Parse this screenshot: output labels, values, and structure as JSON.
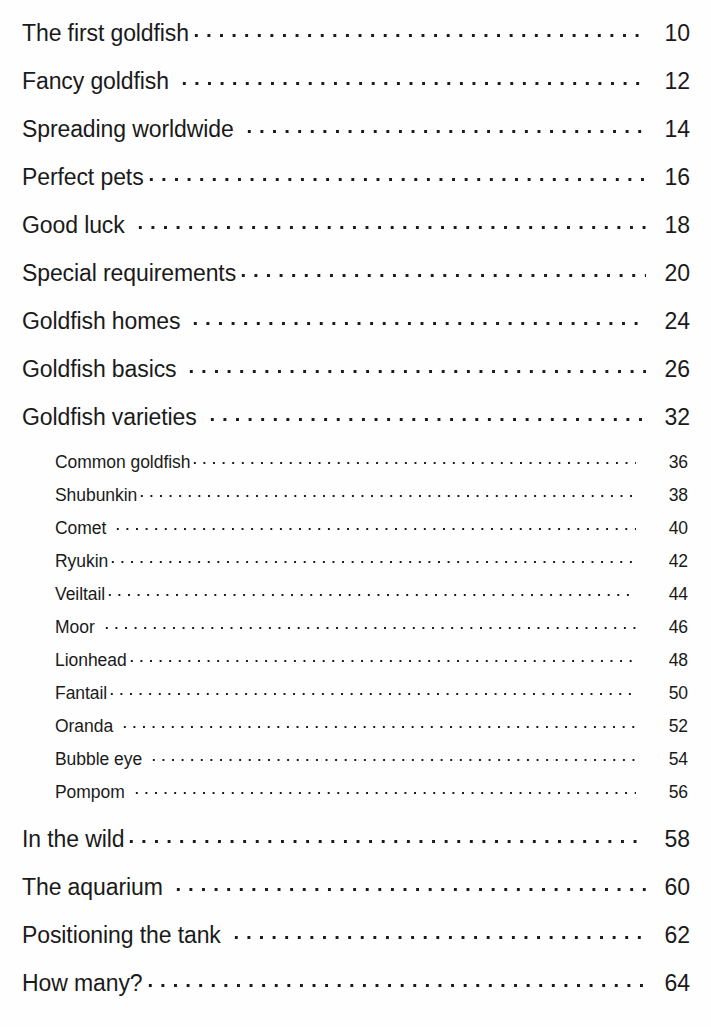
{
  "document": {
    "kind": "table-of-contents",
    "text_color": "#1a1a1a",
    "background_color": "#fefefe"
  },
  "contents": {
    "main_entries_top": [
      {
        "title": "The first goldfish",
        "page": "10",
        "leader_gap": "none"
      },
      {
        "title": "Fancy goldfish",
        "page": "12",
        "leader_gap": "wide"
      },
      {
        "title": "Spreading worldwide",
        "page": "14",
        "leader_gap": "wide"
      },
      {
        "title": "Perfect pets",
        "page": "16",
        "leader_gap": "none"
      },
      {
        "title": "Good luck",
        "page": "18",
        "leader_gap": "wide"
      },
      {
        "title": "Special requirements",
        "page": "20",
        "leader_gap": "none"
      },
      {
        "title": "Goldfish homes",
        "page": "24",
        "leader_gap": "wide"
      },
      {
        "title": "Goldfish basics",
        "page": "26",
        "leader_gap": "wide"
      },
      {
        "title": "Goldfish varieties",
        "page": "32",
        "leader_gap": "wide"
      }
    ],
    "sub_entries": [
      {
        "title": "Common goldfish",
        "page": "36",
        "leader_gap": "none"
      },
      {
        "title": "Shubunkin",
        "page": "38",
        "leader_gap": "none"
      },
      {
        "title": "Comet",
        "page": "40",
        "leader_gap": "wide"
      },
      {
        "title": "Ryukin",
        "page": "42",
        "leader_gap": "none"
      },
      {
        "title": "Veiltail",
        "page": "44",
        "leader_gap": "none"
      },
      {
        "title": "Moor",
        "page": "46",
        "leader_gap": "wide"
      },
      {
        "title": "Lionhead",
        "page": "48",
        "leader_gap": "none"
      },
      {
        "title": "Fantail",
        "page": "50",
        "leader_gap": "none"
      },
      {
        "title": "Oranda",
        "page": "52",
        "leader_gap": "wide"
      },
      {
        "title": "Bubble eye",
        "page": "54",
        "leader_gap": "wide"
      },
      {
        "title": "Pompom",
        "page": "56",
        "leader_gap": "wide"
      }
    ],
    "main_entries_bottom": [
      {
        "title": "In the wild",
        "page": "58",
        "leader_gap": "none"
      },
      {
        "title": "The aquarium",
        "page": "60",
        "leader_gap": "wide"
      },
      {
        "title": "Positioning the tank",
        "page": "62",
        "leader_gap": "wide"
      },
      {
        "title": "How many?",
        "page": "64",
        "leader_gap": "none"
      }
    ]
  }
}
